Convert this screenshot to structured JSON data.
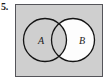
{
  "item": {
    "number_label": "5."
  },
  "figure": {
    "kind": "venn-diagram",
    "set_a_label": "A",
    "set_b_label": "B",
    "panel_fill": "#cfcfcf",
    "panel_border": "#4d4d4d",
    "circle_stroke": "#141414",
    "circle_a_fill": "#cfcfcf",
    "circle_b_fill": "#fdfdfd",
    "intersection_fill": "#cfcfcf"
  }
}
